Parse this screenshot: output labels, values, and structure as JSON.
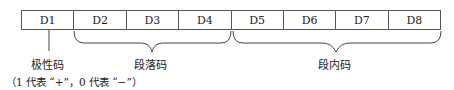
{
  "diagram": {
    "cells": [
      "D1",
      "D2",
      "D3",
      "D4",
      "D5",
      "D6",
      "D7",
      "D8"
    ],
    "labels": {
      "polarity": "极性码",
      "segment": "段落码",
      "intra_segment": "段内码"
    },
    "note": "（1 代表 “+”，0 代表 “−”）"
  }
}
